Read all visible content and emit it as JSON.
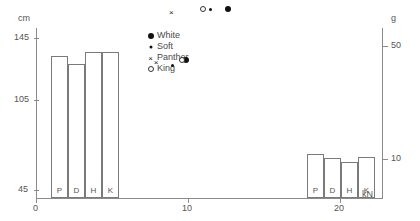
{
  "chart_data": {
    "type": "scatter",
    "title": "",
    "xlabel": "kN",
    "ylabel_left": "cm",
    "ylabel_right": "g",
    "xlim": [
      0,
      23.6
    ],
    "ylim_left": [
      35,
      155
    ],
    "ylim_right": [
      0,
      62
    ],
    "xticks": [
      0,
      10,
      20
    ],
    "xticklabels": [
      "0",
      "10",
      "20"
    ],
    "yticks_left": [
      45,
      105,
      145
    ],
    "yticklabels_left": [
      "45",
      "105",
      "145"
    ],
    "yticks_right": [
      10,
      50
    ],
    "yticklabels_right": [
      "10",
      "50"
    ],
    "grid": false,
    "legend_position": "upper-left-inside",
    "legend": [
      {
        "name": "White",
        "marker": "filled-circle-large"
      },
      {
        "name": "Soft",
        "marker": "filled-circle-small"
      },
      {
        "name": "Panther",
        "marker": "cross"
      },
      {
        "name": "King",
        "marker": "open-circle"
      }
    ],
    "series": [
      {
        "name": "White",
        "marker": "filled-circle-large",
        "points": [
          [
            9.9,
            45
          ],
          [
            12.6,
            63
          ],
          [
            14.0,
            80
          ],
          [
            16.3,
            103
          ],
          [
            18.3,
            132
          ],
          [
            19.8,
            148
          ]
        ]
      },
      {
        "name": "Soft",
        "marker": "filled-circle-small",
        "points": [
          [
            9.0,
            43
          ],
          [
            11.5,
            63
          ],
          [
            14.9,
            104
          ],
          [
            17.2,
            130
          ],
          [
            19.0,
            147
          ]
        ]
      },
      {
        "name": "Panther",
        "marker": "cross",
        "points": [
          [
            7.9,
            44
          ],
          [
            8.9,
            62
          ],
          [
            12.1,
            80
          ],
          [
            15.2,
            104
          ],
          [
            17.6,
            132
          ],
          [
            20.0,
            148
          ]
        ]
      },
      {
        "name": "King",
        "marker": "open-circle",
        "points": [
          [
            9.6,
            45
          ],
          [
            11.0,
            63
          ],
          [
            13.4,
            80
          ],
          [
            16.2,
            86
          ],
          [
            18.4,
            104
          ],
          [
            19.8,
            131
          ],
          [
            21.1,
            145
          ]
        ]
      }
    ],
    "bar_groups": [
      {
        "group": "left",
        "categories": [
          "P",
          "D",
          "H",
          "K"
        ],
        "values": [
          133,
          128,
          136,
          136
        ],
        "baseline": 45,
        "axis": "left"
      },
      {
        "group": "right",
        "categories": [
          "P",
          "D",
          "H",
          "K"
        ],
        "values": [
          11.8,
          10.2,
          9.0,
          10.6
        ],
        "baseline": 0,
        "axis": "right"
      }
    ]
  }
}
